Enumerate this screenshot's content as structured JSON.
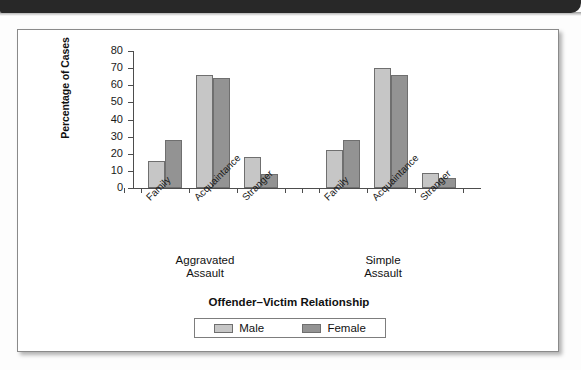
{
  "page": {
    "header_band_color": "#282828",
    "figure_border_color": "#8a8a8a",
    "background_color": "#ffffff"
  },
  "chart_data": {
    "type": "bar",
    "title": "",
    "xlabel": "Offender–Victim Relationship",
    "ylabel": "Percentage of Cases",
    "ylim": [
      0,
      80
    ],
    "ytick_labels": [
      "0",
      "10",
      "20",
      "30",
      "40",
      "50",
      "60",
      "70",
      "80"
    ],
    "yticks": [
      0,
      10,
      20,
      30,
      40,
      50,
      60,
      70,
      80
    ],
    "grid": false,
    "legend_position": "bottom-center",
    "categories": [
      "Family",
      "Acquaintance",
      "Stranger"
    ],
    "groups": [
      {
        "label_line1": "Aggravated",
        "label_line2": "Assault",
        "series": [
          {
            "name": "Male",
            "color": "#c6c6c6",
            "values": [
              16,
              66,
              18
            ]
          },
          {
            "name": "Female",
            "color": "#939393",
            "values": [
              28,
              64,
              8
            ]
          }
        ]
      },
      {
        "label_line1": "Simple",
        "label_line2": "Assault",
        "series": [
          {
            "name": "Male",
            "color": "#c6c6c6",
            "values": [
              22,
              70,
              9
            ]
          },
          {
            "name": "Female",
            "color": "#939393",
            "values": [
              28,
              66,
              6
            ]
          }
        ]
      }
    ],
    "series_names": [
      "Male",
      "Female"
    ],
    "series_colors": [
      "#c6c6c6",
      "#939393"
    ]
  },
  "legend": {
    "items": [
      {
        "label": "Male",
        "color": "#c6c6c6"
      },
      {
        "label": "Female",
        "color": "#939393"
      }
    ]
  }
}
